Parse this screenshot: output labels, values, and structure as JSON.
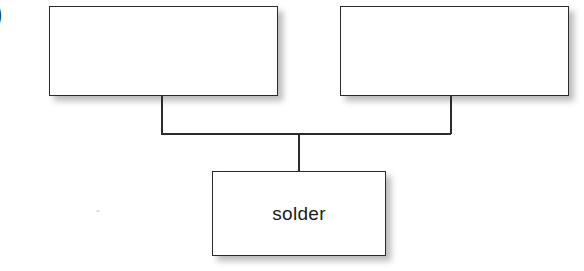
{
  "figure": {
    "type": "block-diagram",
    "background_color": "#ffffff",
    "line_color": "#2b2b2b",
    "text_color": "#1a1a1a",
    "edge_label_fragment": ")"
  },
  "nodes": [
    {
      "id": "left",
      "label": "",
      "x": 49,
      "y": 6,
      "width": 229,
      "height": 90,
      "has_shadow": true
    },
    {
      "id": "right",
      "label": "",
      "x": 340,
      "y": 6,
      "width": 229,
      "height": 90,
      "has_shadow": true
    },
    {
      "id": "solder",
      "label": "solder",
      "x": 212,
      "y": 171,
      "width": 174,
      "height": 85,
      "has_shadow": true
    }
  ],
  "connectors": [
    {
      "id": "left-drop",
      "orientation": "vertical",
      "x": 161,
      "y": 95,
      "length": 39
    },
    {
      "id": "right-drop",
      "orientation": "vertical",
      "x": 450,
      "y": 95,
      "length": 39
    },
    {
      "id": "cross-bar",
      "orientation": "horizontal",
      "x": 161,
      "y": 133,
      "length": 290
    },
    {
      "id": "center-drop",
      "orientation": "vertical",
      "x": 298,
      "y": 133,
      "length": 39
    }
  ]
}
